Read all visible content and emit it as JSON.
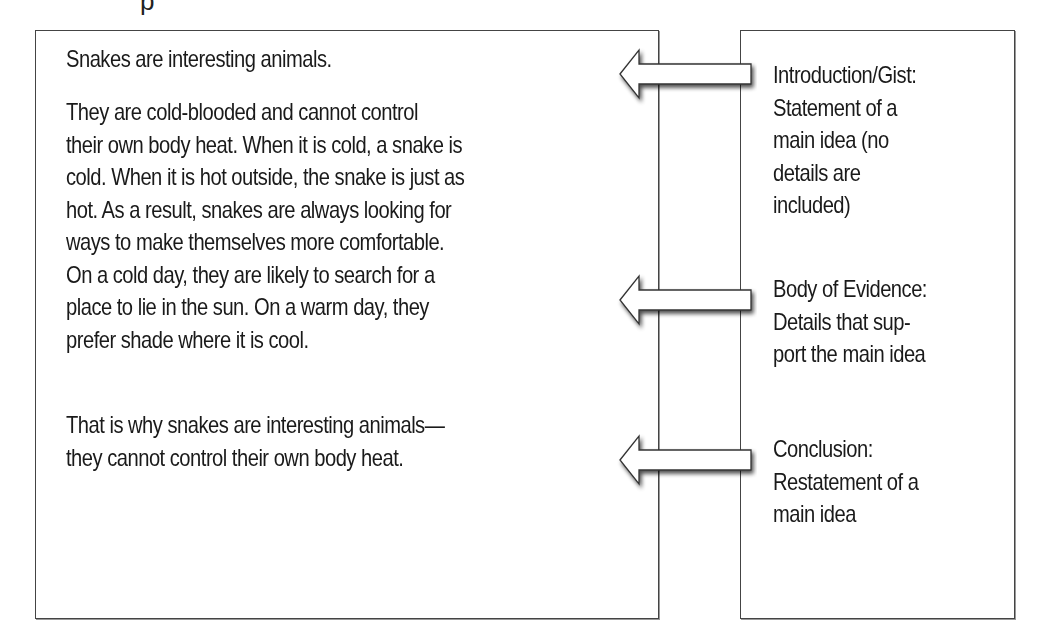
{
  "header_fragment": "p",
  "text_box": {
    "paragraphs": [
      "Snakes are interesting animals.",
      "They are cold-blooded and cannot control their own body heat. When it is cold, a snake is cold. When it is hot outside, the snake is just as hot. As a result, snakes are always looking for ways to make themselves more comfortable. On a cold day, they are likely to search for a place to lie in the sun. On a warm day, they prefer shade where it is cool.",
      "That is why snakes are interesting animals—they cannot control their own body heat."
    ],
    "lines": {
      "intro": [
        "Snakes are interesting animals."
      ],
      "body": [
        "They are cold-blooded and cannot control",
        "their own body heat. When it is cold, a snake is",
        "cold. When it is hot outside, the snake is just as",
        "hot. As a result, snakes are always looking for",
        "ways to make themselves more comfortable.",
        "On a cold day, they are likely to search for a",
        "place to lie in the sun. On a warm day, they",
        "prefer shade where it is cool."
      ],
      "conclusion": [
        "That is why snakes are interesting animals—",
        "they cannot control their own body heat."
      ]
    }
  },
  "labels_box": {
    "labels": [
      {
        "title": "Introduction/Gist:",
        "lines": [
          "Introduction/Gist:",
          "Statement of a",
          "main idea (no",
          "details are",
          "included)"
        ]
      },
      {
        "title": "Body of Evidence:",
        "lines": [
          "Body of Evidence:",
          "Details that sup-",
          "port the main idea"
        ]
      },
      {
        "title": "Conclusion:",
        "lines": [
          "Conclusion:",
          "Restatement of a",
          "main idea"
        ]
      }
    ]
  },
  "arrows": [
    {
      "name": "intro-arrow",
      "direction": "left"
    },
    {
      "name": "body-arrow",
      "direction": "left"
    },
    {
      "name": "conclusion-arrow",
      "direction": "left"
    }
  ]
}
